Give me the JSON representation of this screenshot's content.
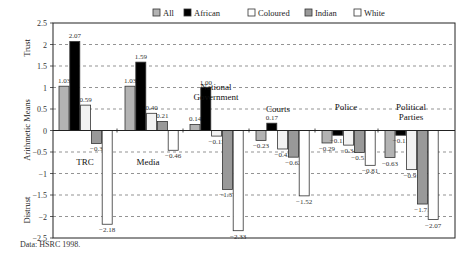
{
  "chart_data": {
    "type": "bar",
    "title": "",
    "xlabel": "",
    "ylabel": "Arithmetic Means",
    "ylabel_top": "Trust",
    "ylabel_bottom": "Distrust",
    "ylim": [
      -2.5,
      2.5
    ],
    "yticks": [
      2.5,
      2,
      1.5,
      1,
      0.5,
      0,
      -0.5,
      -1,
      -1.5,
      -2,
      -2.5
    ],
    "ytick_labels": [
      "2.5",
      "2",
      "1.5",
      "1",
      "0.5",
      "0",
      "−0.5",
      "−1",
      "−1.5",
      "−2",
      "−2.5"
    ],
    "grid": "horizontal dashed",
    "legend_position": "top",
    "categories": [
      "TRC",
      "Media",
      "National Government",
      "Courts",
      "Police",
      "Political Parties"
    ],
    "category_labels": [
      {
        "lines": [
          "TRC"
        ]
      },
      {
        "lines": [
          "Media"
        ]
      },
      {
        "lines": [
          "National",
          "Government"
        ]
      },
      {
        "lines": [
          "Courts"
        ]
      },
      {
        "lines": [
          "Police"
        ]
      },
      {
        "lines": [
          "Political",
          "Parties"
        ]
      }
    ],
    "series": [
      {
        "name": "All",
        "color": "#b3b3b3",
        "values": [
          1.03,
          1.03,
          0.14,
          -0.23,
          -0.29,
          -0.63
        ]
      },
      {
        "name": "African",
        "color": "#000000",
        "values": [
          2.07,
          1.59,
          1.0,
          0.17,
          -0.11,
          -0.11
        ]
      },
      {
        "name": "Coloured",
        "color": "#f2f2f2",
        "values": [
          0.59,
          0.4,
          -0.13,
          -0.43,
          -0.34,
          -0.91
        ]
      },
      {
        "name": "Indian",
        "color": "#999999",
        "values": [
          -0.3,
          0.21,
          -1.37,
          -0.62,
          -0.51,
          -1.71
        ]
      },
      {
        "name": "White",
        "color": "#ffffff",
        "values": [
          -2.18,
          -0.46,
          -2.33,
          -1.52,
          -0.81,
          -2.07
        ]
      }
    ],
    "value_labels": [
      [
        "1.03",
        "2.07",
        "0.59",
        "−0.3",
        "−2.18"
      ],
      [
        "1.03",
        "1.59",
        "0.40",
        "0.21",
        "−0.46"
      ],
      [
        "0.14",
        "1.00",
        "−0.13",
        "−1.37",
        "−2.33"
      ],
      [
        "−0.23",
        "0.17",
        "−0.43",
        "−0.62",
        "−1.52"
      ],
      [
        "−0.29",
        "−0.11",
        "−0.34",
        "−0.51",
        "−0.81"
      ],
      [
        "−0.63",
        "−0.11",
        "−0.91",
        "−1.71",
        "−2.07"
      ]
    ]
  },
  "legend": {
    "items": [
      "All",
      "African",
      "Coloured",
      "Indian",
      "White"
    ]
  },
  "source": {
    "text": "Data: HSRC 1998."
  }
}
